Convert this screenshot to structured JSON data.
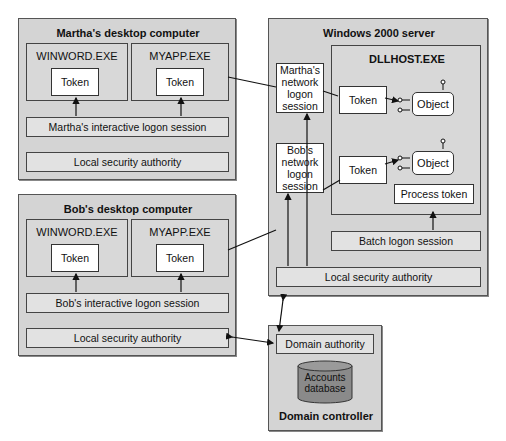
{
  "martha": {
    "title": "Martha's desktop computer",
    "proc1": {
      "name": "WINWORD.EXE",
      "token": "Token"
    },
    "proc2": {
      "name": "MYAPP.EXE",
      "token": "Token"
    },
    "session": "Martha's interactive logon session",
    "lsa": "Local security authority"
  },
  "bob": {
    "title": "Bob's desktop computer",
    "proc1": {
      "name": "WINWORD.EXE",
      "token": "Token"
    },
    "proc2": {
      "name": "MYAPP.EXE",
      "token": "Token"
    },
    "session": "Bob's interactive logon session",
    "lsa": "Local security authority"
  },
  "server": {
    "title": "Windows 2000 server",
    "martha_session": "Martha's network logon session",
    "bob_session": "Bob's network logon session",
    "dllhost": {
      "title": "DLLHOST.EXE",
      "token1": "Token",
      "token2": "Token",
      "object1": "Object",
      "object2": "Object",
      "process_token": "Process token"
    },
    "batch_session": "Batch logon session",
    "lsa": "Local security authority"
  },
  "dc": {
    "title": "Domain controller",
    "authority": "Domain authority",
    "database": "Accounts database"
  },
  "colors": {
    "machine_fill": "#d4d4d4",
    "bar_fill": "#e2e2e2",
    "database_fill": "#8a8a8a"
  }
}
